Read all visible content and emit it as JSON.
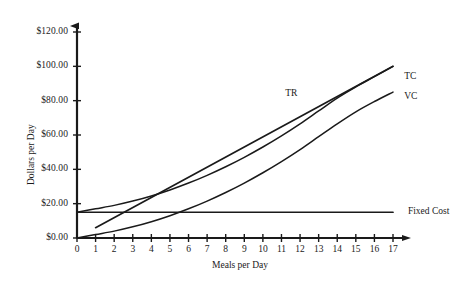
{
  "chart_data": {
    "type": "line",
    "title": "",
    "xlabel": "Meals per Day",
    "ylabel": "Dollars per Day",
    "xlim": [
      0,
      17
    ],
    "ylim": [
      0,
      120
    ],
    "grid": false,
    "legend_position": "inline-right",
    "x_ticks": [
      "0",
      "1",
      "2",
      "3",
      "4",
      "5",
      "6",
      "7",
      "8",
      "9",
      "10",
      "11",
      "12",
      "13",
      "14",
      "15",
      "16",
      "17"
    ],
    "y_ticks": [
      "$0.00",
      "$20.00",
      "$40.00",
      "$60.00",
      "$80.00",
      "$100.00",
      "$120.00"
    ],
    "y_tick_values": [
      0,
      20,
      40,
      60,
      80,
      100,
      120
    ],
    "x_tick_values": [
      0,
      1,
      2,
      3,
      4,
      5,
      6,
      7,
      8,
      9,
      10,
      11,
      12,
      13,
      14,
      15,
      16,
      17
    ],
    "line_color": "#1a1a1a",
    "axis_color": "#1a1a1a",
    "series": [
      {
        "name": "TR",
        "label": "TR",
        "description": "Total Revenue, straight line",
        "x": [
          1,
          17
        ],
        "values": [
          6,
          100
        ]
      },
      {
        "name": "TC",
        "label": "TC",
        "description": "Total Cost, curve starting at fixed cost",
        "x": [
          0,
          1,
          2,
          3,
          4,
          5,
          6,
          7,
          8,
          9,
          10,
          11,
          12,
          13,
          14,
          15,
          16,
          17
        ],
        "values": [
          15,
          17,
          19,
          21.5,
          24.5,
          28,
          32,
          36.5,
          41.5,
          47,
          53,
          59.5,
          66.5,
          74,
          81.5,
          88,
          94,
          100
        ]
      },
      {
        "name": "VC",
        "label": "VC",
        "description": "Variable Cost, curve from origin",
        "x": [
          0,
          1,
          2,
          3,
          4,
          5,
          6,
          7,
          8,
          9,
          10,
          11,
          12,
          13,
          14,
          15,
          16,
          17
        ],
        "values": [
          0,
          2,
          4,
          6.5,
          9.5,
          13,
          17,
          21.5,
          26.5,
          32,
          38,
          44.5,
          51.5,
          59,
          66.5,
          73.5,
          79.5,
          85
        ]
      },
      {
        "name": "FixedCost",
        "label": "Fixed Cost",
        "description": "Fixed Cost, horizontal line",
        "x": [
          0,
          17
        ],
        "values": [
          15,
          15
        ]
      }
    ],
    "annotations": [
      {
        "text": "TR",
        "x": 11.2,
        "y": 84
      },
      {
        "text": "TC",
        "x": 17.6,
        "y": 94
      },
      {
        "text": "VC",
        "x": 17.6,
        "y": 82
      },
      {
        "text": "Fixed Cost",
        "x": 17.8,
        "y": 15
      }
    ]
  }
}
